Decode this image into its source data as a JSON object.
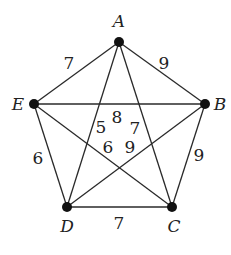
{
  "diagram": {
    "type": "weighted-complete-graph",
    "nodes": [
      {
        "id": "A",
        "label": "A",
        "x": 119,
        "y": 42,
        "lx": 119,
        "ly": 27
      },
      {
        "id": "B",
        "label": "B",
        "x": 205,
        "y": 104,
        "lx": 220,
        "ly": 110
      },
      {
        "id": "C",
        "label": "C",
        "x": 172,
        "y": 207,
        "lx": 174,
        "ly": 232
      },
      {
        "id": "D",
        "label": "D",
        "x": 67,
        "y": 207,
        "lx": 67,
        "ly": 232
      },
      {
        "id": "E",
        "label": "E",
        "x": 34,
        "y": 104,
        "lx": 18,
        "ly": 110
      }
    ],
    "edges": [
      {
        "from": "A",
        "to": "E",
        "weight": "7",
        "lx": 69,
        "ly": 69
      },
      {
        "from": "A",
        "to": "B",
        "weight": "9",
        "lx": 164,
        "ly": 69
      },
      {
        "from": "B",
        "to": "C",
        "weight": "9",
        "lx": 199,
        "ly": 161
      },
      {
        "from": "C",
        "to": "D",
        "weight": "7",
        "lx": 119,
        "ly": 229
      },
      {
        "from": "D",
        "to": "E",
        "weight": "6",
        "lx": 38,
        "ly": 164
      },
      {
        "from": "E",
        "to": "B",
        "weight": "8",
        "lx": 117,
        "ly": 123
      },
      {
        "from": "A",
        "to": "D",
        "weight": "5",
        "lx": 101,
        "ly": 133
      },
      {
        "from": "A",
        "to": "C",
        "weight": "7",
        "lx": 135,
        "ly": 134
      },
      {
        "from": "E",
        "to": "C",
        "weight": "6",
        "lx": 108,
        "ly": 153
      },
      {
        "from": "B",
        "to": "D",
        "weight": "9",
        "lx": 130,
        "ly": 153
      }
    ]
  }
}
